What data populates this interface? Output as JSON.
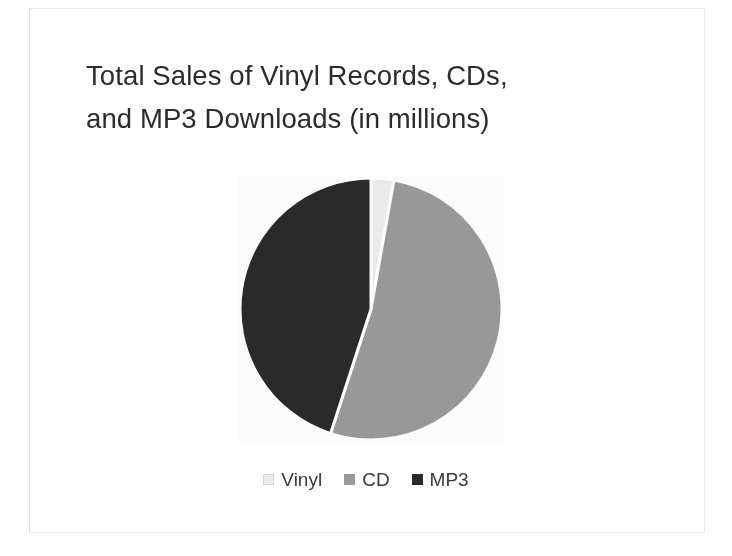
{
  "chart_data": {
    "type": "pie",
    "title": "Total Sales of Vinyl Records, CDs, and MP3 Downloads (in millions)",
    "title_line1": "Total Sales of Vinyl Records, CDs,",
    "title_line2": "and MP3 Downloads (in millions)",
    "categories": [
      "Vinyl",
      "CD",
      "MP3"
    ],
    "values": [
      2.8,
      52.2,
      45.0
    ],
    "value_unit": "percent of total",
    "colors": [
      "#ededed",
      "#9a9a9a",
      "#2a2a2a"
    ],
    "start_angle_deg": 0,
    "direction": "clockwise",
    "legend_position": "bottom",
    "grid": false,
    "data_labels_shown": false,
    "xlabel": "",
    "ylabel": "",
    "slices": [
      {
        "label": "Vinyl",
        "percent": 2.8,
        "color": "#ededed",
        "start_deg": 0.0,
        "end_deg": 10.1
      },
      {
        "label": "CD",
        "percent": 52.2,
        "color": "#9a9a9a",
        "start_deg": 10.1,
        "end_deg": 198.0
      },
      {
        "label": "MP3",
        "percent": 45.0,
        "color": "#2a2a2a",
        "start_deg": 198.0,
        "end_deg": 360.0
      }
    ]
  },
  "legend": {
    "items": [
      {
        "label": "Vinyl",
        "color": "#ededed",
        "swatch_border": "#d5d5d5"
      },
      {
        "label": "CD",
        "color": "#9a9a9a",
        "swatch_border": "#9a9a9a"
      },
      {
        "label": "MP3",
        "color": "#2a2a2a",
        "swatch_border": "#2a2a2a"
      }
    ]
  },
  "theme": {
    "background": "#ffffff",
    "title_color": "#2b2b2b",
    "legend_text_color": "#3a3a3a",
    "slice_separator_color": "#ffffff"
  }
}
